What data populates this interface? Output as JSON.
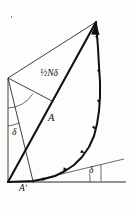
{
  "figure": {
    "kind": "vector-phasor-diagram",
    "background_color": "#fdfdfc",
    "ink_color": "#111111",
    "thin_ink_color": "#3a3a3a",
    "width": 130,
    "height": 215,
    "labels": {
      "half_n_delta": "½Nδ",
      "amplitude_A": "A",
      "amplitude_A_prime": "Aʹ",
      "delta_left": "δ",
      "delta_right": "δ"
    },
    "geometry": {
      "origin_vertex": [
        8,
        182
      ],
      "apex_vertex": [
        96,
        22
      ],
      "left_vertex": [
        8,
        78
      ],
      "chord_foot": [
        33,
        181
      ],
      "baseline_start": [
        8,
        182
      ],
      "baseline_end": [
        126,
        182
      ],
      "tangent_line_end": [
        124,
        160
      ],
      "resultant_label_anchor": [
        52,
        118
      ]
    },
    "arc": {
      "description": "polygonal chain of equal phasor segments bowing right from origin to apex",
      "segment_count": 14,
      "points": [
        [
          33,
          181
        ],
        [
          44,
          179
        ],
        [
          55,
          176
        ],
        [
          65,
          171
        ],
        [
          74,
          165
        ],
        [
          82,
          157
        ],
        [
          89,
          147
        ],
        [
          94,
          136
        ],
        [
          97,
          124
        ],
        [
          99,
          111
        ],
        [
          100,
          97
        ],
        [
          100,
          82
        ],
        [
          99,
          66
        ],
        [
          98,
          48
        ],
        [
          96,
          22
        ]
      ]
    },
    "angle_arcs": [
      {
        "name": "half-n-delta-arc",
        "vertex": [
          8,
          78
        ],
        "radius": 30
      },
      {
        "name": "delta-left-arc",
        "vertex": [
          8,
          78
        ],
        "radius": 48
      },
      {
        "name": "delta-right-arc",
        "vertex": [
          126,
          182
        ],
        "radius": 36
      }
    ]
  }
}
